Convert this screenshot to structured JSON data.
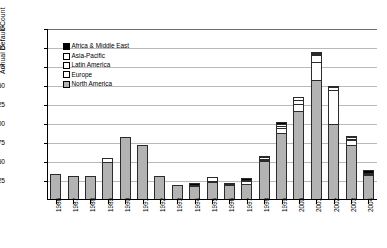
{
  "chart_data": {
    "type": "bar",
    "stacked": true,
    "title": "",
    "xlabel": "",
    "ylabel": "Annual Default Count",
    "ylim": [
      0,
      225
    ],
    "ytick_step": 25,
    "yticks": [
      0,
      25,
      50,
      75,
      100,
      125,
      150,
      175,
      200,
      225
    ],
    "ytick_labels": [
      "0",
      "25",
      "50",
      "75",
      "100",
      "125",
      "150",
      "175",
      "200",
      "225"
    ],
    "grid": true,
    "legend_position": "upper-left-inside",
    "categories": [
      "1986",
      "1987",
      "1988",
      "1989",
      "1990",
      "1991",
      "1992",
      "1993",
      "1994",
      "1995",
      "1996",
      "1997",
      "1998",
      "1999",
      "2000",
      "2001",
      "2002",
      "2003",
      "2004"
    ],
    "series": [
      {
        "name": "North America",
        "color": "#b3b3b3",
        "values": [
          34,
          31,
          31,
          50,
          83,
          73,
          31,
          20,
          18,
          24,
          20,
          21,
          51,
          88,
          117,
          158,
          100,
          72,
          33
        ]
      },
      {
        "name": "Europe",
        "color": "#ffffff",
        "values": [
          0,
          0,
          0,
          0,
          0,
          0,
          0,
          0,
          0,
          0,
          0,
          0,
          2,
          7,
          10,
          24,
          45,
          8,
          0
        ]
      },
      {
        "name": "Latin America",
        "color": "#ffffff",
        "values": [
          0,
          0,
          0,
          6,
          0,
          0,
          0,
          0,
          0,
          7,
          0,
          5,
          4,
          4,
          6,
          10,
          5,
          4,
          0
        ]
      },
      {
        "name": "Asia-Pacific",
        "color": "#ffffff",
        "values": [
          0,
          0,
          0,
          0,
          0,
          0,
          0,
          0,
          1,
          0,
          0,
          0,
          2,
          3,
          5,
          2,
          1,
          2,
          1
        ]
      },
      {
        "name": "Africa & Middle East",
        "color": "#000000",
        "values": [
          0,
          0,
          0,
          0,
          0,
          0,
          0,
          0,
          3,
          0,
          2,
          4,
          0,
          4,
          0,
          3,
          0,
          0,
          5
        ]
      }
    ],
    "totals": [
      34,
      31,
      31,
      56,
      83,
      73,
      31,
      20,
      22,
      31,
      22,
      30,
      59,
      106,
      138,
      197,
      151,
      86,
      39
    ]
  },
  "legend": {
    "items": [
      {
        "label": "Africa & Middle East",
        "swatch": "#000000"
      },
      {
        "label": "Asia-Pacific",
        "swatch": "#ffffff"
      },
      {
        "label": "Latin America",
        "swatch": "#ffffff"
      },
      {
        "label": "Europe",
        "swatch": "#ffffff"
      },
      {
        "label": "North America",
        "swatch": "#b3b3b3"
      }
    ]
  }
}
